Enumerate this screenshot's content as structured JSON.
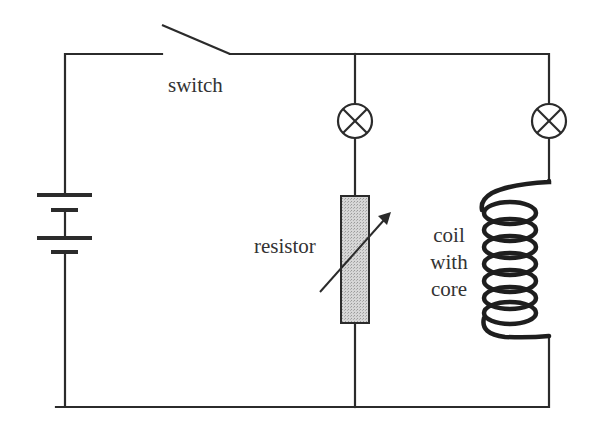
{
  "diagram": {
    "type": "electric circuit",
    "colors": {
      "wire": "#2b2b2b",
      "resistor_fill": "#c8c8c8",
      "text": "#333333",
      "background": "#ffffff"
    },
    "components": {
      "battery": {
        "label": "",
        "icon": "battery-icon",
        "cells": 2
      },
      "switch": {
        "label": "switch",
        "state": "open"
      },
      "lamp_1": {
        "label": "",
        "icon": "lamp-icon",
        "branch": "middle"
      },
      "lamp_2": {
        "label": "",
        "icon": "lamp-icon",
        "branch": "right"
      },
      "resistor": {
        "label": "resistor",
        "variable": true
      },
      "coil": {
        "label_lines": [
          "coil",
          "with",
          "core"
        ],
        "turns": 7
      }
    }
  }
}
